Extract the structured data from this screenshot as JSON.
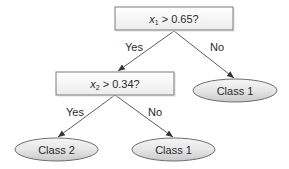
{
  "diagram": {
    "type": "decision-tree",
    "colors": {
      "box_border": "#7a7a7a",
      "box_fill_top": "#ffffff",
      "box_fill_bottom": "#ececec",
      "ellipse_border": "#6e6e6e",
      "ellipse_fill_top": "#f4f4f4",
      "ellipse_fill_bottom": "#cfcfcf",
      "edge": "#4a4a4a",
      "text": "#2a2a2a"
    },
    "nodes": {
      "root": {
        "kind": "decision",
        "var": "x",
        "sub": "1",
        "condition": " > 0.65?"
      },
      "split2": {
        "kind": "decision",
        "var": "x",
        "sub": "2",
        "condition": " > 0.34?"
      },
      "leaf_root_no": {
        "kind": "leaf",
        "label": "Class 1"
      },
      "leaf_split2_yes": {
        "kind": "leaf",
        "label": "Class 2"
      },
      "leaf_split2_no": {
        "kind": "leaf",
        "label": "Class 1"
      }
    },
    "edges": {
      "root_yes": {
        "from": "root",
        "to": "split2",
        "label": "Yes"
      },
      "root_no": {
        "from": "root",
        "to": "leaf_root_no",
        "label": "No"
      },
      "split2_yes": {
        "from": "split2",
        "to": "leaf_split2_yes",
        "label": "Yes"
      },
      "split2_no": {
        "from": "split2",
        "to": "leaf_split2_no",
        "label": "No"
      }
    }
  }
}
